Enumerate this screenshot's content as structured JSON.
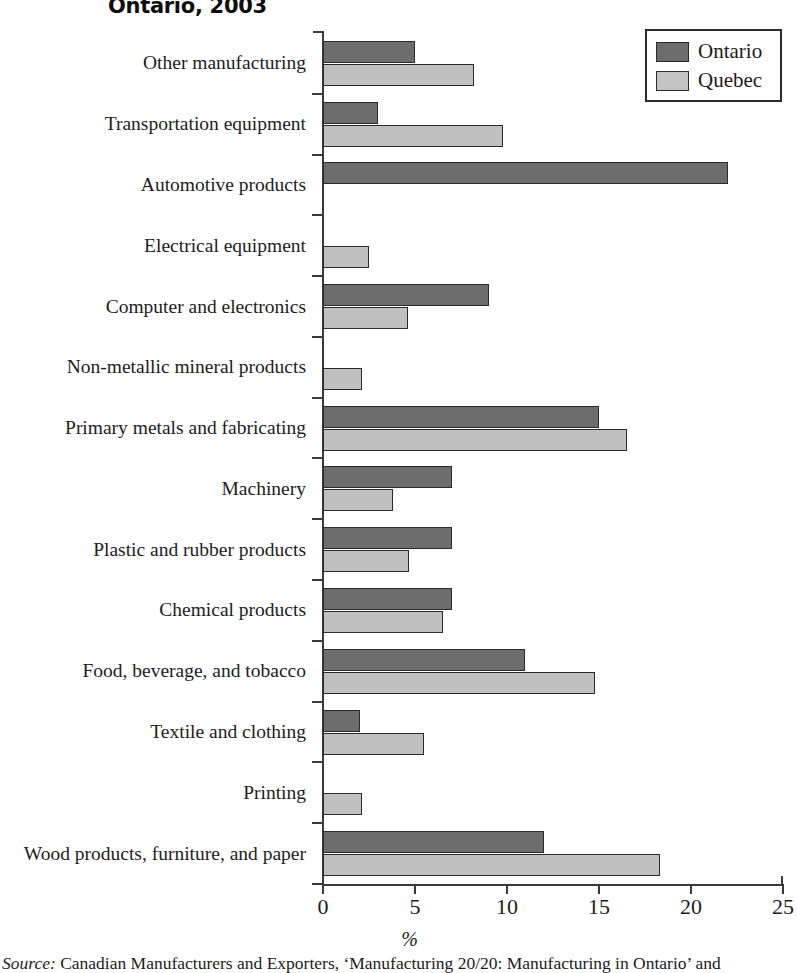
{
  "title": "Ontario, 2003",
  "legend": {
    "position": "top-right",
    "entries": [
      {
        "label": "Ontario",
        "color": "#6d6d6d",
        "swatch": "ontario-swatch"
      },
      {
        "label": "Quebec",
        "color": "#c4c4c4",
        "swatch": "quebec-swatch"
      }
    ]
  },
  "axis": {
    "xlabel": "%",
    "ticks": [
      "0",
      "5",
      "10",
      "15",
      "20",
      "25"
    ]
  },
  "source": {
    "label": "Source:",
    "text": "Canadian Manufacturers and Exporters, ‘Manufacturing 20/20: Manufacturing in Ontario’ and"
  },
  "chart_data": {
    "type": "bar",
    "orientation": "horizontal",
    "title": "Ontario, 2003",
    "xlabel": "%",
    "ylabel": "",
    "xlim": [
      0,
      25
    ],
    "xticks": [
      0,
      5,
      10,
      15,
      20,
      25
    ],
    "grid": false,
    "legend_position": "top-right",
    "categories": [
      "Other manufacturing",
      "Transportation equipment",
      "Automotive products",
      "Electrical equipment",
      "Computer and electronics",
      "Non-metallic mineral products",
      "Primary metals and fabricating",
      "Machinery",
      "Plastic and rubber products",
      "Chemical products",
      "Food, beverage, and tobacco",
      "Textile and clothing",
      "Printing",
      "Wood products, furniture, and paper"
    ],
    "series": [
      {
        "name": "Ontario",
        "color": "#6d6d6d",
        "values": [
          5.0,
          3.0,
          22.0,
          0,
          9.0,
          0,
          15.0,
          7.0,
          7.0,
          7.0,
          11.0,
          2.0,
          0,
          12.0
        ]
      },
      {
        "name": "Quebec",
        "color": "#c4c4c4",
        "values": [
          8.2,
          9.8,
          0,
          2.5,
          4.6,
          2.1,
          16.5,
          3.8,
          4.7,
          6.5,
          14.8,
          5.5,
          2.1,
          18.3
        ]
      }
    ]
  }
}
